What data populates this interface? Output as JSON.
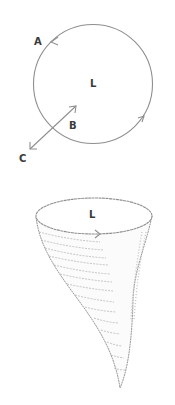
{
  "figure": {
    "stroke_color": "#8f8f8f",
    "label_color": "#3a3a3a",
    "circle_diagram": {
      "labels": {
        "A": "A",
        "B": "B",
        "C": "C",
        "L": "L"
      }
    },
    "vortex_diagram": {
      "labels": {
        "L": "L"
      }
    }
  }
}
